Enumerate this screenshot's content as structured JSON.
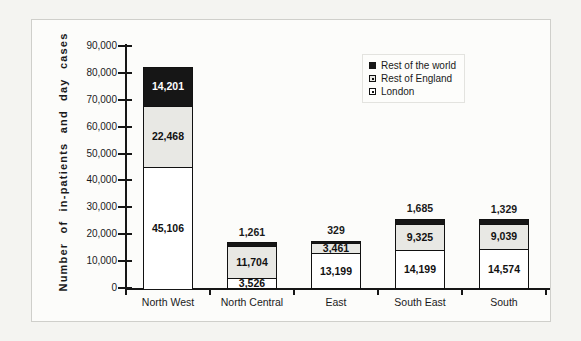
{
  "page": {
    "background": "#f4f4f1"
  },
  "panel": {
    "background": "#fcfcfa",
    "border_color": "#cfcfcb"
  },
  "chart_data": {
    "type": "bar",
    "stacked": true,
    "title": "",
    "xlabel": "",
    "ylabel": "Number of in-patients and day cases",
    "ylim": [
      0,
      90000
    ],
    "ytick_step": 10000,
    "grid": false,
    "legend_position": "top-right",
    "categories": [
      "North West",
      "North Central",
      "East",
      "South East",
      "South"
    ],
    "series": [
      {
        "name": "London",
        "color": "#ffffff",
        "values": [
          45106,
          3526,
          13199,
          14199,
          14574
        ]
      },
      {
        "name": "Rest of England",
        "color": "#e8e8e4",
        "values": [
          22468,
          11704,
          3461,
          9325,
          9039
        ]
      },
      {
        "name": "Rest of the world",
        "color": "#161616",
        "values": [
          14201,
          1261,
          329,
          1685,
          1329
        ]
      }
    ],
    "value_labels": {
      "London": [
        "45,106",
        "3,526",
        "13,199",
        "14,199",
        "14,574"
      ],
      "Rest of England": [
        "22,468",
        "11,704",
        "3,461",
        "9,325",
        "9,039"
      ],
      "Rest of the world": [
        "14,201",
        "1,261",
        "329",
        "1,685",
        "1,329"
      ]
    },
    "ytick_labels": [
      "0",
      "10,000",
      "20,000",
      "30,000",
      "40,000",
      "50,000",
      "60,000",
      "70,000",
      "80,000",
      "90,000"
    ]
  },
  "legend": {
    "items": [
      {
        "label": "Rest of the world",
        "fill": "#161616",
        "dot": false
      },
      {
        "label": "Rest of England",
        "fill": "#e8e8e4",
        "dot": true
      },
      {
        "label": "London",
        "fill": "#ffffff",
        "dot": true
      }
    ]
  }
}
